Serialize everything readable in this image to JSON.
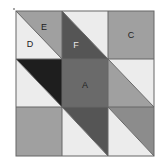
{
  "diagram": {
    "type": "quilt-block-grid",
    "grid": {
      "rows": 3,
      "cols": 3
    },
    "colors": {
      "light": "#ececec",
      "mid": "#a0a0a0",
      "dark": "#555555",
      "black": "#1e1e1e",
      "line": "#666666",
      "label_dark": "#222222",
      "label_light": "#e8e8e8"
    },
    "labels": {
      "A": "A",
      "C": "C",
      "D": "D",
      "E": "E",
      "F": "F"
    }
  }
}
